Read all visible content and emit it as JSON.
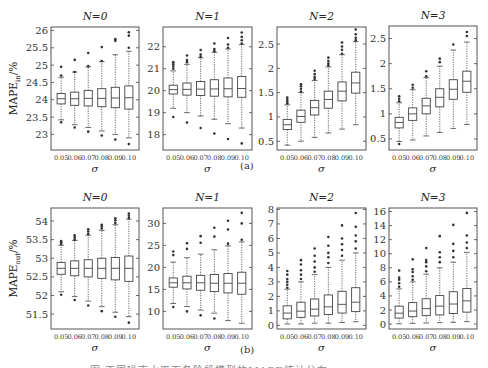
{
  "figure": {
    "sublabel_a": "(a)",
    "sublabel_b": "(b)",
    "caption": "图 不同噪声水平下各阶段模型的MAPE统计分布"
  },
  "chart_data": [
    {
      "type": "box",
      "row": "a",
      "title": "N=0",
      "xlabel": "σ",
      "ylabel": "MAPE_in/%",
      "categories": [
        "0.05",
        "0.06",
        "0.07",
        "0.08",
        "0.09",
        "0.10"
      ],
      "ylim": [
        22.55,
        26.1
      ],
      "yticks": [
        23,
        23.5,
        24,
        24.5,
        25,
        25.5,
        26
      ],
      "boxes": [
        {
          "q1": 23.88,
          "median": 24.03,
          "q3": 24.18,
          "wlo": 23.42,
          "whi": 24.65,
          "outliers": [
            23.35,
            24.7,
            24.95
          ]
        },
        {
          "q1": 23.84,
          "median": 24.03,
          "q3": 24.22,
          "wlo": 23.28,
          "whi": 24.8,
          "outliers": [
            23.2,
            24.8,
            25.15
          ]
        },
        {
          "q1": 23.82,
          "median": 24.04,
          "q3": 24.27,
          "wlo": 23.2,
          "whi": 24.95,
          "outliers": [
            23.08,
            24.97,
            25.35
          ]
        },
        {
          "q1": 23.8,
          "median": 24.04,
          "q3": 24.32,
          "wlo": 23.1,
          "whi": 25.1,
          "outliers": [
            22.97,
            25.12,
            25.52
          ]
        },
        {
          "q1": 23.77,
          "median": 24.05,
          "q3": 24.36,
          "wlo": 23.0,
          "whi": 25.3,
          "outliers": [
            22.85,
            25.7,
            25.75
          ]
        },
        {
          "q1": 23.73,
          "median": 24.06,
          "q3": 24.4,
          "wlo": 22.9,
          "whi": 25.4,
          "outliers": [
            22.72,
            25.5,
            25.85,
            25.95
          ]
        }
      ]
    },
    {
      "type": "box",
      "row": "a",
      "title": "N=1",
      "xlabel": "σ",
      "ylabel": "",
      "categories": [
        "0.05",
        "0.06",
        "0.07",
        "0.08",
        "0.09",
        "0.10"
      ],
      "ylim": [
        17.3,
        22.9
      ],
      "yticks": [
        18,
        19,
        20,
        21,
        22
      ],
      "boxes": [
        {
          "q1": 19.85,
          "median": 20.05,
          "q3": 20.25,
          "wlo": 19.2,
          "whi": 20.9,
          "outliers": [
            18.8,
            21.0,
            21.1,
            21.2,
            21.3
          ]
        },
        {
          "q1": 19.8,
          "median": 20.06,
          "q3": 20.35,
          "wlo": 19.0,
          "whi": 21.2,
          "outliers": [
            18.55,
            21.3,
            21.4,
            21.6
          ]
        },
        {
          "q1": 19.78,
          "median": 20.07,
          "q3": 20.42,
          "wlo": 18.85,
          "whi": 21.5,
          "outliers": [
            18.3,
            21.55,
            21.65,
            21.85
          ]
        },
        {
          "q1": 19.75,
          "median": 20.08,
          "q3": 20.5,
          "wlo": 18.7,
          "whi": 21.75,
          "outliers": [
            18.05,
            21.8,
            21.9,
            22.15
          ]
        },
        {
          "q1": 19.72,
          "median": 20.09,
          "q3": 20.58,
          "wlo": 18.5,
          "whi": 21.9,
          "outliers": [
            17.8,
            21.95,
            22.1,
            22.4
          ]
        },
        {
          "q1": 19.7,
          "median": 20.1,
          "q3": 20.65,
          "wlo": 18.3,
          "whi": 22.1,
          "outliers": [
            17.6,
            22.15,
            22.3,
            22.45,
            22.65
          ]
        }
      ]
    },
    {
      "type": "box",
      "row": "a",
      "title": "N=2",
      "xlabel": "σ",
      "ylabel": "",
      "categories": [
        "0.05",
        "0.06",
        "0.07",
        "0.08",
        "0.09",
        "0.10"
      ],
      "ylim": [
        0.32,
        2.85
      ],
      "yticks": [
        0.5,
        1,
        1.5,
        2,
        2.5
      ],
      "boxes": [
        {
          "q1": 0.74,
          "median": 0.84,
          "q3": 0.95,
          "wlo": 0.42,
          "whi": 1.25,
          "outliers": [
            1.28,
            1.32,
            1.36,
            1.4
          ]
        },
        {
          "q1": 0.89,
          "median": 1.01,
          "q3": 1.14,
          "wlo": 0.5,
          "whi": 1.5,
          "outliers": [
            1.52,
            1.58,
            1.63,
            1.67
          ]
        },
        {
          "q1": 1.04,
          "median": 1.19,
          "q3": 1.34,
          "wlo": 0.58,
          "whi": 1.75,
          "outliers": [
            1.78,
            1.82,
            1.88,
            1.95
          ]
        },
        {
          "q1": 1.18,
          "median": 1.36,
          "q3": 1.53,
          "wlo": 0.67,
          "whi": 2.03,
          "outliers": [
            2.06,
            2.1,
            2.15,
            2.22
          ]
        },
        {
          "q1": 1.33,
          "median": 1.53,
          "q3": 1.72,
          "wlo": 0.75,
          "whi": 2.28,
          "outliers": [
            2.3,
            2.38,
            2.45,
            2.53
          ]
        },
        {
          "q1": 1.49,
          "median": 1.7,
          "q3": 1.92,
          "wlo": 0.84,
          "whi": 2.55,
          "outliers": [
            2.58,
            2.63,
            2.7,
            2.8
          ]
        }
      ]
    },
    {
      "type": "box",
      "row": "a",
      "title": "N=3",
      "xlabel": "σ",
      "ylabel": "",
      "categories": [
        "0.05",
        "0.06",
        "0.07",
        "0.08",
        "0.09",
        "0.10"
      ],
      "ylim": [
        0.28,
        2.75
      ],
      "yticks": [
        0.5,
        1,
        1.5,
        2,
        2.5
      ],
      "boxes": [
        {
          "q1": 0.72,
          "median": 0.83,
          "q3": 0.93,
          "wlo": 0.45,
          "whi": 1.22,
          "outliers": [
            0.4,
            1.25,
            1.3,
            1.35
          ]
        },
        {
          "q1": 0.87,
          "median": 1.0,
          "q3": 1.12,
          "wlo": 0.48,
          "whi": 1.48,
          "outliers": [
            1.52,
            1.58
          ]
        },
        {
          "q1": 1.0,
          "median": 1.16,
          "q3": 1.31,
          "wlo": 0.56,
          "whi": 1.72,
          "outliers": [
            1.75,
            1.85
          ]
        },
        {
          "q1": 1.14,
          "median": 1.33,
          "q3": 1.5,
          "wlo": 0.63,
          "whi": 1.95,
          "outliers": [
            2.03,
            2.1
          ]
        },
        {
          "q1": 1.29,
          "median": 1.49,
          "q3": 1.68,
          "wlo": 0.71,
          "whi": 2.27,
          "outliers": [
            2.38
          ]
        },
        {
          "q1": 1.43,
          "median": 1.65,
          "q3": 1.85,
          "wlo": 0.79,
          "whi": 2.43,
          "outliers": [
            2.55,
            2.63
          ]
        }
      ]
    },
    {
      "type": "box",
      "row": "b",
      "title": "N=0",
      "xlabel": "σ",
      "ylabel": "MAPE_out/%",
      "categories": [
        "0.05",
        "0.06",
        "0.07",
        "0.08",
        "0.09",
        "0.10"
      ],
      "ylim": [
        51.1,
        54.35
      ],
      "yticks": [
        51.5,
        52,
        52.5,
        53,
        53.5,
        54
      ],
      "boxes": [
        {
          "q1": 52.57,
          "median": 52.73,
          "q3": 52.89,
          "wlo": 52.1,
          "whi": 53.35,
          "outliers": [
            52.02,
            53.38,
            53.42,
            53.46
          ]
        },
        {
          "q1": 52.53,
          "median": 52.73,
          "q3": 52.93,
          "wlo": 51.97,
          "whi": 53.48,
          "outliers": [
            51.88,
            53.5,
            53.56,
            53.62
          ]
        },
        {
          "q1": 52.5,
          "median": 52.73,
          "q3": 52.96,
          "wlo": 51.85,
          "whi": 53.62,
          "outliers": [
            51.73,
            53.65,
            53.72,
            53.78
          ]
        },
        {
          "q1": 52.46,
          "median": 52.73,
          "q3": 53.0,
          "wlo": 51.7,
          "whi": 53.75,
          "outliers": [
            51.58,
            53.8,
            53.85,
            53.9
          ]
        },
        {
          "q1": 52.42,
          "median": 52.73,
          "q3": 53.02,
          "wlo": 51.55,
          "whi": 53.9,
          "outliers": [
            51.43,
            53.95,
            54.02,
            54.07
          ]
        },
        {
          "q1": 52.38,
          "median": 52.73,
          "q3": 53.06,
          "wlo": 51.43,
          "whi": 54.05,
          "outliers": [
            51.27,
            54.08,
            54.14,
            54.2
          ]
        }
      ]
    },
    {
      "type": "box",
      "row": "b",
      "title": "N=1",
      "xlabel": "σ",
      "ylabel": "",
      "categories": [
        "0.05",
        "0.06",
        "0.07",
        "0.08",
        "0.09",
        "0.10"
      ],
      "ylim": [
        6.0,
        33.5
      ],
      "yticks": [
        10,
        15,
        20,
        25,
        30
      ],
      "boxes": [
        {
          "q1": 15.5,
          "median": 16.5,
          "q3": 17.6,
          "wlo": 11.8,
          "whi": 21.2,
          "outliers": [
            11.0,
            22.8,
            23.6
          ]
        },
        {
          "q1": 15.1,
          "median": 16.5,
          "q3": 18.0,
          "wlo": 11.1,
          "whi": 22.2,
          "outliers": [
            10.0,
            24.2,
            25.5
          ]
        },
        {
          "q1": 14.8,
          "median": 16.5,
          "q3": 18.2,
          "wlo": 10.3,
          "whi": 23.0,
          "outliers": [
            9.1,
            25.6,
            27.1
          ]
        },
        {
          "q1": 14.5,
          "median": 16.4,
          "q3": 18.4,
          "wlo": 9.6,
          "whi": 24.0,
          "outliers": [
            8.4,
            27.0,
            29.0
          ]
        },
        {
          "q1": 14.2,
          "median": 16.4,
          "q3": 18.6,
          "wlo": 7.9,
          "whi": 24.9,
          "outliers": [
            25.4,
            28.6,
            30.6
          ]
        },
        {
          "q1": 13.9,
          "median": 16.4,
          "q3": 18.9,
          "wlo": 7.3,
          "whi": 25.8,
          "outliers": [
            26.3,
            30.0,
            32.4
          ]
        }
      ]
    },
    {
      "type": "box",
      "row": "b",
      "title": "N=2",
      "xlabel": "σ",
      "ylabel": "",
      "categories": [
        "0.05",
        "0.06",
        "0.07",
        "0.08",
        "0.09",
        "0.10"
      ],
      "ylim": [
        -0.25,
        8.1
      ],
      "yticks": [
        0,
        1,
        2,
        3,
        4,
        5,
        6,
        7,
        8
      ],
      "boxes": [
        {
          "q1": 0.45,
          "median": 0.85,
          "q3": 1.35,
          "wlo": 0.1,
          "whi": 2.5,
          "outliers": [
            2.6,
            2.8,
            3.0,
            3.2,
            3.5,
            3.75
          ]
        },
        {
          "q1": 0.55,
          "median": 0.98,
          "q3": 1.6,
          "wlo": 0.1,
          "whi": 3.0,
          "outliers": [
            3.2,
            3.5,
            3.8,
            4.2,
            4.5
          ]
        },
        {
          "q1": 0.65,
          "median": 1.12,
          "q3": 1.82,
          "wlo": 0.15,
          "whi": 3.5,
          "outliers": [
            3.7,
            4.0,
            4.4,
            4.8,
            5.3
          ]
        },
        {
          "q1": 0.75,
          "median": 1.28,
          "q3": 2.1,
          "wlo": 0.15,
          "whi": 4.0,
          "outliers": [
            4.3,
            4.7,
            5.0,
            5.5,
            6.1
          ]
        },
        {
          "q1": 0.85,
          "median": 1.45,
          "q3": 2.35,
          "wlo": 0.2,
          "whi": 4.5,
          "outliers": [
            4.8,
            5.2,
            5.6,
            6.0,
            6.9
          ]
        },
        {
          "q1": 0.95,
          "median": 1.6,
          "q3": 2.6,
          "wlo": 0.25,
          "whi": 5.0,
          "outliers": [
            5.3,
            5.8,
            6.2,
            6.8,
            7.75
          ]
        }
      ]
    },
    {
      "type": "box",
      "row": "b",
      "title": "N=3",
      "xlabel": "σ",
      "ylabel": "",
      "categories": [
        "0.05",
        "0.06",
        "0.07",
        "0.08",
        "0.09",
        "0.10"
      ],
      "ylim": [
        -0.7,
        16.5
      ],
      "yticks": [
        0,
        2,
        4,
        6,
        8,
        10,
        12,
        14,
        16
      ],
      "boxes": [
        {
          "q1": 0.85,
          "median": 1.55,
          "q3": 2.55,
          "wlo": 0.05,
          "whi": 5.0,
          "outliers": [
            5.3,
            5.8,
            6.3,
            6.6,
            7.6
          ]
        },
        {
          "q1": 1.05,
          "median": 1.85,
          "q3": 3.05,
          "wlo": 0.1,
          "whi": 6.0,
          "outliers": [
            6.3,
            6.8,
            7.4,
            7.8,
            9.2
          ]
        },
        {
          "q1": 1.2,
          "median": 2.2,
          "q3": 3.6,
          "wlo": 0.15,
          "whi": 7.1,
          "outliers": [
            7.5,
            8.2,
            8.8,
            9.1,
            10.8
          ]
        },
        {
          "q1": 1.3,
          "median": 2.55,
          "q3": 4.05,
          "wlo": 0.2,
          "whi": 8.0,
          "outliers": [
            8.8,
            9.5,
            10.2,
            12.5
          ]
        },
        {
          "q1": 1.5,
          "median": 2.85,
          "q3": 4.6,
          "wlo": 0.25,
          "whi": 8.8,
          "outliers": [
            9.5,
            10.4,
            11.4,
            14.1
          ]
        },
        {
          "q1": 1.7,
          "median": 3.3,
          "q3": 5.05,
          "wlo": 0.35,
          "whi": 10.2,
          "outliers": [
            10.8,
            11.6,
            12.6,
            15.8
          ]
        }
      ]
    }
  ]
}
